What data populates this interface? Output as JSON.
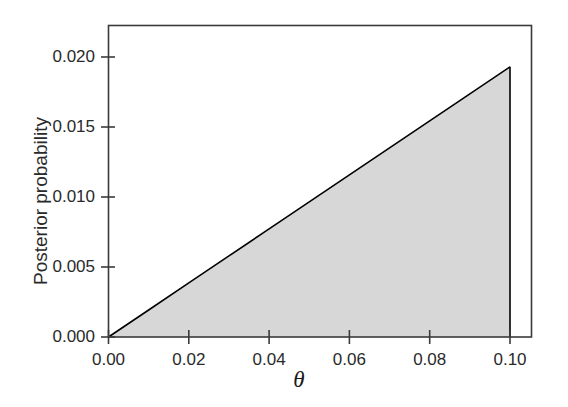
{
  "chart_data": {
    "type": "area",
    "title": "",
    "subtitle": "",
    "xlabel": "θ",
    "ylabel": "Posterior probability",
    "xlim": [
      -0.003,
      0.1055
    ],
    "ylim": [
      -0.0006,
      0.02235
    ],
    "xticks": [
      0.0,
      0.02,
      0.04,
      0.06,
      0.08,
      0.1
    ],
    "xtick_labels": [
      "0.00",
      "0.02",
      "0.04",
      "0.06",
      "0.08",
      "0.10"
    ],
    "yticks": [
      0.0,
      0.005,
      0.01,
      0.015,
      0.02
    ],
    "ytick_labels": [
      "0.000",
      "0.005",
      "0.010",
      "0.015",
      "0.020"
    ],
    "grid": false,
    "legend": null,
    "legend_position": "none",
    "frame": true,
    "series": [
      {
        "name": "Posterior probability",
        "kind": "area",
        "fill_color": "#d7d7d7",
        "line_color": "#000000",
        "x": [
          0.0,
          0.01,
          0.02,
          0.03,
          0.04,
          0.05,
          0.06,
          0.07,
          0.08,
          0.09,
          0.1,
          0.1
        ],
        "y": [
          0.0,
          0.00193,
          0.00386,
          0.00579,
          0.00772,
          0.00965,
          0.01158,
          0.01351,
          0.01544,
          0.01737,
          0.0193,
          0.0
        ]
      }
    ],
    "annotations": []
  },
  "axes": {
    "ylabel": "Posterior probability",
    "xlabel": "θ",
    "ytick_labels": [
      "0.020",
      "0.015",
      "0.010",
      "0.005",
      "0.000"
    ],
    "xtick_labels": [
      "0.00",
      "0.02",
      "0.04",
      "0.06",
      "0.08",
      "0.10"
    ]
  },
  "colors": {
    "fill": "#d7d7d7",
    "line": "#000000",
    "frame": "#3a3a3a",
    "text": "#2a2a2a",
    "background": "#ffffff"
  }
}
